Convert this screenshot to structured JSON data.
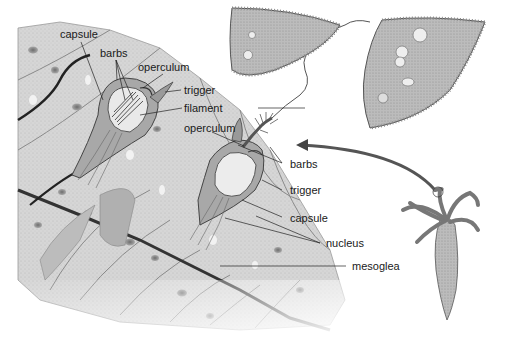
{
  "figure": {
    "colors": {
      "background": "#ffffff",
      "cell_fill": "#d4d4d4",
      "cell_dark": "#9a9a9a",
      "outline": "#2a2a2a",
      "nucleus": "#8a8a8a",
      "arrow": "#555555",
      "label_text": "#1a1a1a"
    }
  },
  "labels": {
    "undischarged": {
      "capsule": "capsule",
      "barbs": "barbs",
      "operculum": "operculum",
      "trigger": "trigger",
      "filament": "filament"
    },
    "discharged": {
      "operculum": "operculum",
      "barbs": "barbs",
      "trigger": "trigger",
      "capsule": "capsule",
      "nucleus": "nucleus",
      "mesoglea": "mesoglea"
    }
  }
}
